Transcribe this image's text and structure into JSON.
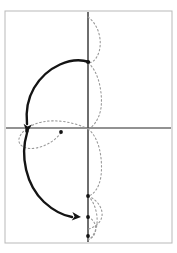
{
  "figure": {
    "canvas": {
      "width": 177,
      "height": 253,
      "background": "#ffffff"
    },
    "frame": {
      "name": "page-border",
      "x": 5,
      "y": 11,
      "width": 167,
      "height": 232,
      "stroke": "#b9b9b9",
      "stroke_width": 1
    },
    "axes": {
      "origin": {
        "x": 88,
        "y": 128
      },
      "horizontal": {
        "label": "x-axis",
        "x1": 6,
        "y1": 128,
        "x2": 171,
        "y2": 128,
        "stroke": "#6e6e6e",
        "stroke_width": 1.6
      },
      "vertical": {
        "label": "y-axis",
        "x1": 88,
        "y1": 12,
        "x2": 88,
        "y2": 242,
        "stroke": "#4a4a4a",
        "stroke_width": 1.6
      }
    },
    "dotted_curve": {
      "label": "original-curve-dotted",
      "stroke": "#9a9a9a",
      "stroke_width": 1.1,
      "dash": "1.5 2.5",
      "description": "chain of right-bulging lobes running down the vertical axis, plus a small left lobe at the origin",
      "lobes": [
        {
          "name": "lobe-top",
          "path": "M 88,17 C 100,26 102,42 99,52 C 96,61 91,63 88,63"
        },
        {
          "name": "lobe-upper-mid",
          "path": "M 88,63 C 98,70 103,92 101,108 C 99,120 93,127 88,129"
        },
        {
          "name": "lobe-origin-left",
          "path": "M 88,129 C 74,122 56,119 42,122 C 28,125 20,133 19,139 C 18,146 26,150 36,148 C 48,146 58,138 62,131"
        },
        {
          "name": "lobe-lower-mid",
          "path": "M 88,129 C 99,137 103,158 101,176 C 99,189 93,195 88,196"
        },
        {
          "name": "lobe-bottom-upper",
          "path": "M 88,196 C 98,200 103,209 102,216 C 101,223 94,228 88,229"
        },
        {
          "name": "lobe-bottom-lower",
          "path": "M 88,196 C 96,203 99,219 96,229 C 93,237 90,239 88,240"
        },
        {
          "name": "lobe-bottom-small",
          "path": "M 88,217 C 95,220 97,227 95,233 C 93,238 90,239 88,239"
        }
      ]
    },
    "solid_arrows": {
      "label": "transformation-arrows",
      "stroke": "#141414",
      "stroke_width": 2.4,
      "arrows": [
        {
          "name": "arrow-upper",
          "description": "curves left and down from the upper axis point to the origin-left marker",
          "path": "M 89,62 C 72,56 47,66 34,88 C 27,100 26,114 27,124",
          "head": {
            "x": 27,
            "y": 133,
            "angle": 95
          }
        },
        {
          "name": "arrow-lower",
          "description": "curves left, down and right from the origin-left marker to the lower axis point",
          "path": "M 27,133 C 20,156 26,185 44,202 C 55,212 66,216 72,217",
          "head": {
            "x": 81,
            "y": 217,
            "angle": 5
          }
        }
      ]
    },
    "markers": [
      {
        "name": "point-upper-axis",
        "x": 88,
        "y": 62,
        "r": 1.9,
        "fill": "#141414"
      },
      {
        "name": "point-origin-left",
        "x": 27,
        "y": 131,
        "r": 1.9,
        "fill": "#141414"
      },
      {
        "name": "point-origin-right",
        "x": 61,
        "y": 132,
        "r": 1.9,
        "fill": "#141414"
      },
      {
        "name": "point-lower-upper-axis",
        "x": 88,
        "y": 196,
        "r": 1.9,
        "fill": "#141414"
      },
      {
        "name": "point-lower-axis",
        "x": 88,
        "y": 217,
        "r": 1.9,
        "fill": "#141414"
      },
      {
        "name": "point-bottom-axis",
        "x": 88,
        "y": 236,
        "r": 1.9,
        "fill": "#141414"
      }
    ]
  }
}
